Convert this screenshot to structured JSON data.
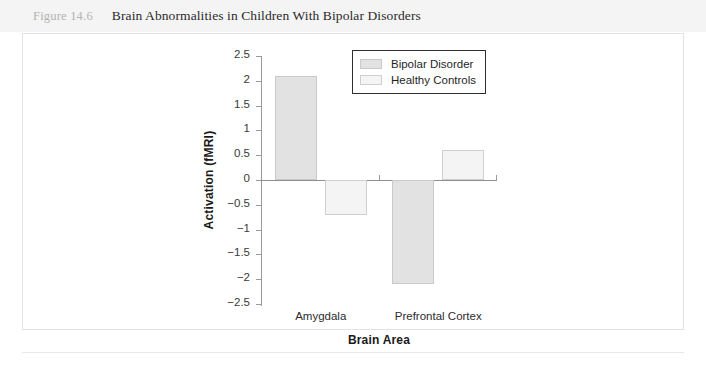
{
  "caption": {
    "figure_number": "Figure 14.6",
    "title": "Brain Abnormalities in Children With Bipolar Disorders"
  },
  "chart_data": {
    "type": "bar",
    "title": "Brain Abnormalities in Children With Bipolar Disorders",
    "categories": [
      "Amygdala",
      "Prefrontal Cortex"
    ],
    "series": [
      {
        "name": "Bipolar Disorder",
        "values": [
          2.1,
          -2.1
        ],
        "color": "#e2e2e2"
      },
      {
        "name": "Healthy Controls",
        "values": [
          -0.7,
          0.6
        ],
        "color": "#f4f4f4"
      }
    ],
    "xlabel": "Brain Area",
    "ylabel": "Activation (fMRI)",
    "ylim": [
      -2.5,
      2.5
    ],
    "ytick_step": 0.5,
    "yticks": [
      "2.5",
      "2",
      "1.5",
      "1",
      "0.5",
      "0",
      "-0.5",
      "-1",
      "-1.5",
      "-2",
      "-2.5"
    ],
    "grid": false,
    "legend_position": "top-right-inside"
  }
}
